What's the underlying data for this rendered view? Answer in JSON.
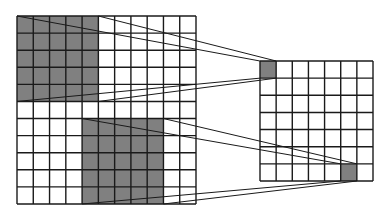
{
  "diagram": {
    "type": "receptive-field-pooling",
    "colors": {
      "background": "#ffffff",
      "grid_line": "#1a1a1a",
      "highlight_fill": "#808080",
      "projection_line": "#1a1a1a"
    },
    "input_grid": {
      "rows": 11,
      "cols": 11,
      "x": 17,
      "y": 16,
      "width": 179,
      "height": 188,
      "highlighted_blocks": [
        {
          "row": 0,
          "col": 0,
          "rows": 5,
          "cols": 5
        },
        {
          "row": 6,
          "col": 4,
          "rows": 5,
          "cols": 5
        }
      ]
    },
    "output_grid": {
      "rows": 7,
      "cols": 7,
      "x": 260,
      "y": 61,
      "width": 113,
      "height": 120,
      "highlighted_cells": [
        {
          "row": 0,
          "col": 0
        },
        {
          "row": 6,
          "col": 5
        }
      ]
    },
    "projections": [
      {
        "from_block": 0,
        "to_cell": 0
      },
      {
        "from_block": 1,
        "to_cell": 1
      }
    ]
  }
}
